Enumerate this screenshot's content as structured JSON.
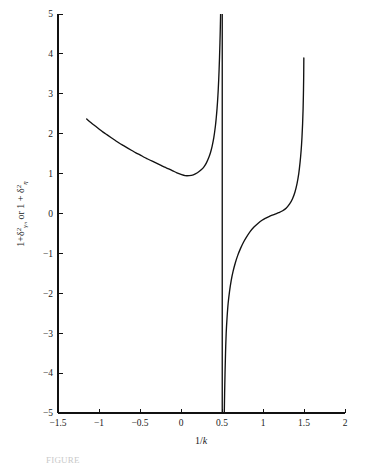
{
  "figure": {
    "background_color": "#ffffff",
    "line_color": "#121212",
    "axis_color": "#111111",
    "caption_partial": "FIGURE"
  },
  "chart_data": {
    "type": "line",
    "title": "",
    "subtitle": "",
    "xlabel": "1/k",
    "xlabel_parts": {
      "numerator": "1/",
      "variable": "k"
    },
    "ylabel": "1 + δ²γₙ or 1 + δ²η",
    "ylabel_parts": {
      "lead": "1+",
      "delta": "δ",
      "sup1": "2",
      "sub1": "γₙ",
      "conj": " or 1 + ",
      "delta2": "δ",
      "sup2": "2",
      "sub2": "η"
    },
    "xlim": [
      -1.5,
      2
    ],
    "ylim": [
      -5,
      5
    ],
    "xticks": [
      -1.5,
      -1,
      -0.5,
      0,
      0.5,
      1,
      1.5,
      2
    ],
    "xticklabels": [
      "-1.5",
      "-1",
      "-0.5",
      "0",
      "0.5",
      "1",
      "1.5",
      "2"
    ],
    "yticks": [
      -5,
      -4,
      -3,
      -2,
      -1,
      0,
      1,
      2,
      3,
      4,
      5
    ],
    "yticklabels": [
      "-5",
      "-4",
      "-3",
      "-2",
      "-1",
      "0",
      "1",
      "2",
      "3",
      "4",
      "5"
    ],
    "grid": false,
    "legend": null,
    "legend_position": "none",
    "asymptotes": [
      0.5,
      0.53
    ],
    "series": [
      {
        "name": "branch-left",
        "comment": "descends from (-1.15, 2.37), minimum near (0.03, 0.95), rises to vertical asymptote at x = 0.5",
        "points": [
          [
            -1.15,
            2.37
          ],
          [
            -1.1,
            2.28
          ],
          [
            -1.05,
            2.2
          ],
          [
            -1.0,
            2.12
          ],
          [
            -0.95,
            2.04
          ],
          [
            -0.9,
            1.97
          ],
          [
            -0.85,
            1.9
          ],
          [
            -0.8,
            1.83
          ],
          [
            -0.75,
            1.76
          ],
          [
            -0.7,
            1.7
          ],
          [
            -0.65,
            1.64
          ],
          [
            -0.6,
            1.58
          ],
          [
            -0.55,
            1.52
          ],
          [
            -0.5,
            1.47
          ],
          [
            -0.45,
            1.41
          ],
          [
            -0.4,
            1.36
          ],
          [
            -0.35,
            1.31
          ],
          [
            -0.3,
            1.26
          ],
          [
            -0.25,
            1.21
          ],
          [
            -0.2,
            1.16
          ],
          [
            -0.15,
            1.12
          ],
          [
            -0.1,
            1.07
          ],
          [
            -0.05,
            1.02
          ],
          [
            0.0,
            0.98
          ],
          [
            0.05,
            0.95
          ],
          [
            0.1,
            0.95
          ],
          [
            0.15,
            0.97
          ],
          [
            0.2,
            1.02
          ],
          [
            0.25,
            1.1
          ],
          [
            0.28,
            1.17
          ],
          [
            0.31,
            1.27
          ],
          [
            0.34,
            1.41
          ],
          [
            0.36,
            1.53
          ],
          [
            0.38,
            1.69
          ],
          [
            0.4,
            1.9
          ],
          [
            0.42,
            2.2
          ],
          [
            0.43,
            2.4
          ],
          [
            0.44,
            2.64
          ],
          [
            0.45,
            2.95
          ],
          [
            0.455,
            3.14
          ],
          [
            0.46,
            3.36
          ],
          [
            0.465,
            3.62
          ],
          [
            0.47,
            3.92
          ],
          [
            0.475,
            4.28
          ],
          [
            0.48,
            4.7
          ],
          [
            0.483,
            5.0
          ]
        ]
      },
      {
        "name": "asymptote-left-vertical",
        "comment": "near-vertical segment at x = 0.503 spanning the full y-range",
        "points": [
          [
            0.503,
            5.0
          ],
          [
            0.503,
            -5.0
          ]
        ]
      },
      {
        "name": "branch-right",
        "comment": "rises from -5 near x = 0.53, inflection plateau near y = 0 around x = 1.15, steep rise to 3.9 at x = 1.5",
        "points": [
          [
            0.528,
            -5.0
          ],
          [
            0.532,
            -4.5
          ],
          [
            0.537,
            -4.0
          ],
          [
            0.543,
            -3.5
          ],
          [
            0.551,
            -3.0
          ],
          [
            0.562,
            -2.6
          ],
          [
            0.575,
            -2.25
          ],
          [
            0.592,
            -1.95
          ],
          [
            0.612,
            -1.68
          ],
          [
            0.635,
            -1.45
          ],
          [
            0.662,
            -1.24
          ],
          [
            0.692,
            -1.05
          ],
          [
            0.725,
            -0.88
          ],
          [
            0.762,
            -0.72
          ],
          [
            0.802,
            -0.58
          ],
          [
            0.845,
            -0.45
          ],
          [
            0.89,
            -0.34
          ],
          [
            0.938,
            -0.25
          ],
          [
            0.988,
            -0.17
          ],
          [
            1.04,
            -0.11
          ],
          [
            1.09,
            -0.06
          ],
          [
            1.14,
            -0.02
          ],
          [
            1.19,
            0.02
          ],
          [
            1.24,
            0.07
          ],
          [
            1.285,
            0.14
          ],
          [
            1.325,
            0.24
          ],
          [
            1.36,
            0.37
          ],
          [
            1.39,
            0.54
          ],
          [
            1.415,
            0.75
          ],
          [
            1.436,
            1.0
          ],
          [
            1.452,
            1.28
          ],
          [
            1.465,
            1.58
          ],
          [
            1.475,
            1.9
          ],
          [
            1.483,
            2.25
          ],
          [
            1.489,
            2.62
          ],
          [
            1.493,
            3.0
          ],
          [
            1.496,
            3.4
          ],
          [
            1.498,
            3.9
          ]
        ]
      }
    ]
  }
}
